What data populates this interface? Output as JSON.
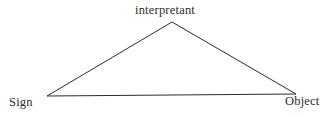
{
  "diagram": {
    "type": "semiotic-triangle",
    "background_color": "#ffffff",
    "line_color": "#2b2b2b",
    "text_color": "#2b2b2b",
    "line_width": 1,
    "nodes": [
      {
        "id": "interpretant",
        "label": "interpretant",
        "x": 172,
        "y": 22,
        "role": "apex"
      },
      {
        "id": "sign",
        "label": "Sign",
        "x": 47,
        "y": 96,
        "role": "bottom-left"
      },
      {
        "id": "object",
        "label": "Object",
        "x": 296,
        "y": 94,
        "role": "bottom-right"
      }
    ],
    "edges": [
      {
        "from": "sign",
        "to": "interpretant"
      },
      {
        "from": "interpretant",
        "to": "object"
      },
      {
        "from": "sign",
        "to": "object"
      }
    ],
    "polygon_points": "47,96 172,22 296,94 47,96"
  }
}
